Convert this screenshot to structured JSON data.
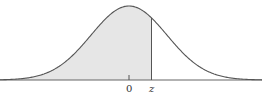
{
  "diagram": {
    "type": "normal-distribution-curve",
    "shaded_region": "left tail up to z",
    "labels": {
      "mean": "0",
      "z": "z"
    },
    "colors": {
      "curve": "#555555",
      "fill": "#e6e6e6",
      "axis": "#666666",
      "background": "#ffffff"
    }
  },
  "chart_data": {
    "type": "area",
    "title": "",
    "xlabel": "",
    "ylabel": "",
    "tick_labels": [
      "0",
      "z"
    ],
    "mean": 0,
    "std": 1,
    "shaded_from": "-inf",
    "shaded_to": "z",
    "z_approx": 0.6
  }
}
